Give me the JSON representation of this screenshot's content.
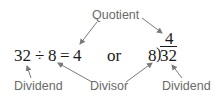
{
  "labels": {
    "quotient": "Quotient",
    "dividend_left": "Dividend",
    "divisor": "Divisor",
    "dividend_right": "Dividend"
  },
  "equation": {
    "dividend": "32",
    "operator": "÷",
    "divisor": "8",
    "equals": "=",
    "quotient": "4"
  },
  "connector": "or",
  "long_division": {
    "quotient": "4",
    "divisor": "8",
    "bracket": ")",
    "dividend": "32"
  },
  "colors": {
    "label": "#6a6a6a",
    "math": "#1a1a1a",
    "arrow": "#7a7a7a"
  }
}
